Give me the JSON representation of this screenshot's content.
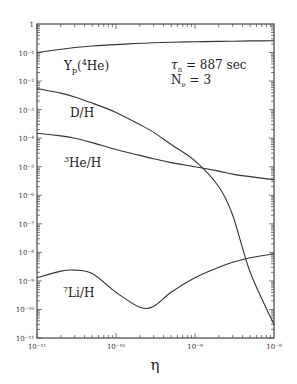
{
  "chart_data": {
    "type": "line",
    "title": "",
    "xlabel": "η",
    "ylabel": "",
    "xscale": "log",
    "yscale": "log",
    "xlim": [
      1e-11,
      1e-08
    ],
    "ylim": [
      1e-11,
      1
    ],
    "grid": false,
    "legend": "none (inline curve labels)",
    "x_tick_labels": [
      "10⁻¹¹",
      "10⁻¹⁰",
      "10⁻⁹",
      "10⁻⁸"
    ],
    "y_tick_labels": [
      "1",
      "10⁻¹",
      "10⁻²",
      "10⁻³",
      "10⁻⁴",
      "10⁻⁵",
      "10⁻⁶",
      "10⁻⁷",
      "10⁻⁸",
      "10⁻⁹",
      "10⁻¹⁰",
      "10⁻¹¹"
    ],
    "x": [
      1e-11,
      2e-11,
      3e-11,
      5e-11,
      1e-10,
      2e-10,
      3e-10,
      5e-10,
      1e-09,
      2e-09,
      3e-09,
      5e-09,
      1e-08
    ],
    "series": [
      {
        "name": "Yp(4He)",
        "label": "Yp(⁴He)",
        "values": [
          0.1,
          0.13,
          0.15,
          0.17,
          0.19,
          0.21,
          0.22,
          0.23,
          0.24,
          0.245,
          0.25,
          0.255,
          0.26
        ]
      },
      {
        "name": "D/H",
        "label": "D/H",
        "values": [
          0.0055,
          0.0038,
          0.0028,
          0.0017,
          0.0008,
          0.0003,
          0.00016,
          6e-05,
          1.6e-05,
          2e-06,
          2e-07,
          2e-09,
          3e-11
        ]
      },
      {
        "name": "3He/H",
        "label": "³He/H",
        "values": [
          0.00015,
          0.00012,
          0.0001,
          7e-05,
          4e-05,
          2.5e-05,
          1.9e-05,
          1.4e-05,
          1e-05,
          7e-06,
          5.5e-06,
          4.5e-06,
          3.5e-06
        ]
      },
      {
        "name": "7Li/H",
        "label": "⁷Li/H",
        "values": [
          1.3e-09,
          2.2e-09,
          2.4e-09,
          1.8e-09,
          4e-10,
          1.2e-10,
          1.3e-10,
          4e-10,
          1.3e-09,
          3e-09,
          4.5e-09,
          6.5e-09,
          9e-09
        ]
      }
    ],
    "annotations": [
      "τn = 887 sec",
      "Nν = 3"
    ]
  },
  "labels": {
    "yp": {
      "main": "Y",
      "sub": "p",
      "open": "(",
      "sup": "4",
      "rest": "He)"
    },
    "dh": "D/H",
    "he3": {
      "sup": "3",
      "rest": "He/H"
    },
    "li7": {
      "sup": "7",
      "rest": "Li/H"
    },
    "tau": {
      "sym": "τ",
      "sub": "n",
      "rest": " = 887 sec"
    },
    "nnu": {
      "sym": "N",
      "sub": "ν",
      "rest": " = 3"
    },
    "xaxis": "η"
  },
  "colors": {
    "curve": "#333333",
    "axis": "#444444",
    "background": "#ffffff"
  }
}
